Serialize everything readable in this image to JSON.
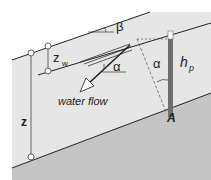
{
  "diagram": {
    "title": "",
    "labels": {
      "beta": "β",
      "z_w": "z",
      "z_w_sub": "w",
      "alpha_flow": "α",
      "alpha_piezo": "α",
      "h_p": "h",
      "h_p_sub": "p",
      "flow": "water flow",
      "z": "z",
      "point": "A"
    },
    "colors": {
      "soil": "#e4e4e4",
      "bedrock": "#bdbdbd",
      "line": "#222222",
      "piezometer": "#6e6e6e"
    }
  }
}
